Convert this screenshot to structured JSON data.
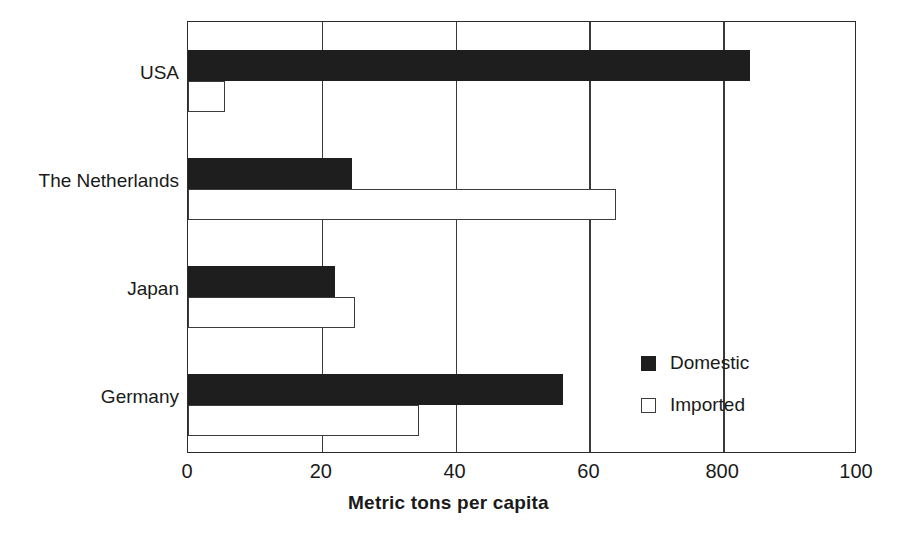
{
  "chart_data": {
    "type": "bar",
    "orientation": "horizontal",
    "title": "",
    "subtitle": "",
    "xlabel": "Metric tons per capita",
    "ylabel": "",
    "xlim": [
      0,
      100
    ],
    "xticks": [
      0,
      20,
      40,
      60,
      80,
      100
    ],
    "xtick_labels": [
      "0",
      "20",
      "40",
      "60",
      "800",
      "100"
    ],
    "grid": "vertical",
    "legend_position": "inside-lower-right",
    "categories": [
      "USA",
      "The Netherlands",
      "Japan",
      "Germany"
    ],
    "series": [
      {
        "name": "Domestic",
        "color": "#1e1e1e",
        "style": "filled",
        "values": [
          84,
          24.5,
          22,
          56
        ]
      },
      {
        "name": "Imported",
        "color": "#ffffff",
        "style": "hollow",
        "values": [
          5.5,
          64,
          25,
          34.5
        ]
      }
    ]
  },
  "axis": {
    "x_title": "Metric tons per capita"
  },
  "legend": {
    "items": [
      {
        "label": "Domestic",
        "style": "filled"
      },
      {
        "label": "Imported",
        "style": "hollow"
      }
    ]
  }
}
